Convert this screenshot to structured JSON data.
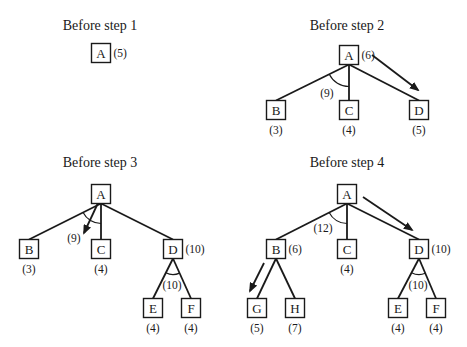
{
  "figure": {
    "width": 467,
    "height": 347,
    "colors": {
      "ink": "#1a1a1a",
      "background": "#ffffff"
    },
    "panels": [
      {
        "id": "step1",
        "title": "Before step 1",
        "title_pos": [
          100,
          30
        ],
        "nodes": [
          {
            "id": "A",
            "label": "A",
            "x": 101,
            "y": 53,
            "cost": "(5)",
            "cost_side": "right"
          }
        ],
        "edges": [],
        "and_arcs": [],
        "arrows": []
      },
      {
        "id": "step2",
        "title": "Before step 2",
        "title_pos": [
          347,
          30
        ],
        "nodes": [
          {
            "id": "A",
            "label": "A",
            "x": 349,
            "y": 55,
            "cost": "(6)",
            "cost_side": "right"
          },
          {
            "id": "B",
            "label": "B",
            "x": 276,
            "y": 110,
            "cost": "(3)",
            "cost_side": "below"
          },
          {
            "id": "C",
            "label": "C",
            "x": 349,
            "y": 110,
            "cost": "(4)",
            "cost_side": "below"
          },
          {
            "id": "D",
            "label": "D",
            "x": 419,
            "y": 110,
            "cost": "(5)",
            "cost_side": "below"
          }
        ],
        "edges": [
          [
            "A",
            "B"
          ],
          [
            "A",
            "C"
          ],
          [
            "A",
            "D"
          ]
        ],
        "and_arcs": [
          {
            "at": "A",
            "from": "B",
            "to": "C",
            "r": 22,
            "label": "(9)",
            "label_pos": [
              327,
              97
            ]
          }
        ],
        "arrows": [
          {
            "from": [
              372,
              55
            ],
            "to": [
              418,
              90
            ]
          }
        ]
      },
      {
        "id": "step3",
        "title": "Before step 3",
        "title_pos": [
          100,
          167
        ],
        "nodes": [
          {
            "id": "A",
            "label": "A",
            "x": 101,
            "y": 194
          },
          {
            "id": "B",
            "label": "B",
            "x": 29,
            "y": 249,
            "cost": "(3)",
            "cost_side": "below"
          },
          {
            "id": "C",
            "label": "C",
            "x": 101,
            "y": 249,
            "cost": "(4)",
            "cost_side": "below"
          },
          {
            "id": "D",
            "label": "D",
            "x": 173,
            "y": 249,
            "cost": "(10)",
            "cost_side": "right"
          },
          {
            "id": "E",
            "label": "E",
            "x": 153,
            "y": 308,
            "cost": "(4)",
            "cost_side": "below"
          },
          {
            "id": "F",
            "label": "F",
            "x": 191,
            "y": 308,
            "cost": "(4)",
            "cost_side": "below"
          }
        ],
        "edges": [
          [
            "A",
            "B"
          ],
          [
            "A",
            "C"
          ],
          [
            "A",
            "D"
          ],
          [
            "D",
            "E"
          ],
          [
            "D",
            "F"
          ]
        ],
        "and_arcs": [
          {
            "at": "A",
            "from": "B",
            "to": "C",
            "r": 20,
            "label": "(9)",
            "label_pos": [
              74,
              242
            ]
          },
          {
            "at": "D",
            "from": "E",
            "to": "F",
            "r": 16,
            "label": "(10)",
            "label_pos": [
              172,
              289
            ]
          }
        ],
        "arrows": [
          {
            "from": [
              98,
              203
            ],
            "to": [
              84,
              233
            ]
          }
        ]
      },
      {
        "id": "step4",
        "title": "Before step 4",
        "title_pos": [
          347,
          167
        ],
        "nodes": [
          {
            "id": "A",
            "label": "A",
            "x": 347,
            "y": 194
          },
          {
            "id": "B",
            "label": "B",
            "x": 276,
            "y": 249,
            "cost": "(6)",
            "cost_side": "right"
          },
          {
            "id": "C",
            "label": "C",
            "x": 347,
            "y": 249,
            "cost": "(4)",
            "cost_side": "below"
          },
          {
            "id": "D",
            "label": "D",
            "x": 419,
            "y": 249,
            "cost": "(10)",
            "cost_side": "right"
          },
          {
            "id": "G",
            "label": "G",
            "x": 257,
            "y": 308,
            "cost": "(5)",
            "cost_side": "below"
          },
          {
            "id": "H",
            "label": "H",
            "x": 295,
            "y": 308,
            "cost": "(7)",
            "cost_side": "below"
          },
          {
            "id": "E",
            "label": "E",
            "x": 398,
            "y": 308,
            "cost": "(4)",
            "cost_side": "below"
          },
          {
            "id": "F",
            "label": "F",
            "x": 436,
            "y": 308,
            "cost": "(4)",
            "cost_side": "below"
          }
        ],
        "edges": [
          [
            "A",
            "B"
          ],
          [
            "A",
            "C"
          ],
          [
            "A",
            "D"
          ],
          [
            "B",
            "G"
          ],
          [
            "B",
            "H"
          ],
          [
            "D",
            "E"
          ],
          [
            "D",
            "F"
          ]
        ],
        "and_arcs": [
          {
            "at": "A",
            "from": "B",
            "to": "C",
            "r": 20,
            "label": "(12)",
            "label_pos": [
              323,
              232
            ]
          },
          {
            "at": "D",
            "from": "E",
            "to": "F",
            "r": 16,
            "label": "(10)",
            "label_pos": [
              418,
              289
            ]
          }
        ],
        "arrows": [
          {
            "from": [
              363,
              197
            ],
            "to": [
              412,
              230
            ]
          },
          {
            "from": [
              264,
              263
            ],
            "to": [
              250,
              291
            ]
          }
        ]
      }
    ]
  }
}
